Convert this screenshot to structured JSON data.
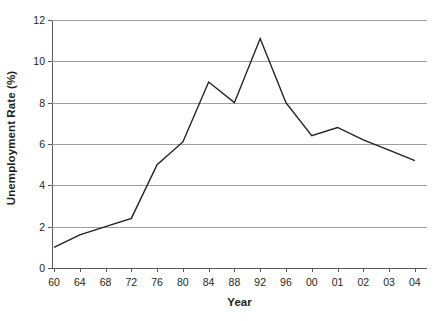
{
  "chart_data": {
    "type": "line",
    "title": "",
    "xlabel": "Year",
    "ylabel": "Unemployment Rate (%)",
    "categories": [
      "60",
      "64",
      "68",
      "72",
      "76",
      "80",
      "84",
      "88",
      "92",
      "96",
      "00",
      "01",
      "02",
      "03",
      "04"
    ],
    "values": [
      1.0,
      1.6,
      2.0,
      2.4,
      5.0,
      6.1,
      9.0,
      8.0,
      11.1,
      8.0,
      6.4,
      6.8,
      6.2,
      5.7,
      5.2
    ],
    "series": [
      {
        "name": "Unemployment Rate",
        "values": [
          1.0,
          1.6,
          2.0,
          2.4,
          5.0,
          6.1,
          9.0,
          8.0,
          11.1,
          8.0,
          6.4,
          6.8,
          6.2,
          5.7,
          5.2
        ]
      }
    ],
    "ylim": [
      0,
      12
    ],
    "yticks": [
      0,
      2,
      4,
      6,
      8,
      10,
      12
    ],
    "ytick_labels": [
      "0",
      "2",
      "4",
      "6",
      "8",
      "10",
      "12"
    ],
    "grid": true,
    "grid_axis": "y",
    "legend": "none",
    "line_color": "#231f20",
    "grid_color": "#9d9d9d",
    "axis_color": "#58595b",
    "background_color": "#ffffff"
  }
}
